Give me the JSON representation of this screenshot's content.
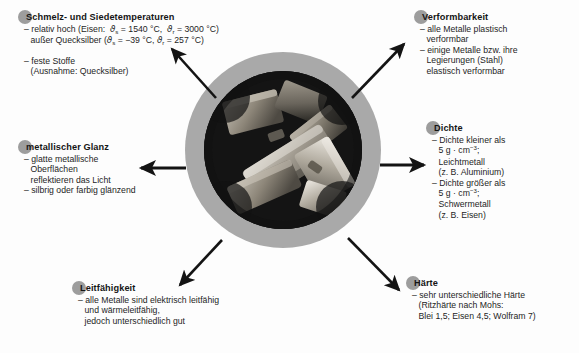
{
  "figure": {
    "type": "radial-callout-diagram",
    "center_image": {
      "name": "metal-ingots-photo",
      "description": "Foto von metallischen Barren / Stangen auf dunklem Grund",
      "ring_color": "#a9a9a9",
      "background_color": "#121212"
    },
    "arrow_count": 6
  },
  "callouts": [
    {
      "id": "melting",
      "heading": "Schmelz- und Siedetemperaturen",
      "lines": [
        {
          "text": "– relativ hoch (Eisen:  ϑs = 1540 °C,  ϑr = 3000 °C)",
          "indent": false
        },
        {
          "text": "außer Quecksilber (ϑs = −39 °C, ϑr = 257 °C)",
          "indent": true
        },
        {
          "text": "",
          "indent": false
        },
        {
          "text": "– feste Stoffe",
          "indent": false
        },
        {
          "text": "(Ausnahme: Quecksilber)",
          "indent": true
        }
      ]
    },
    {
      "id": "gloss",
      "heading": "metallischer Glanz",
      "lines": [
        {
          "text": "– glatte metallische",
          "indent": false
        },
        {
          "text": "Oberflächen",
          "indent": true
        },
        {
          "text": "reflektieren das Licht",
          "indent": true
        },
        {
          "text": "– silbrig oder farbig glänzend",
          "indent": false
        }
      ]
    },
    {
      "id": "conductivity",
      "heading": "Leitfähigkeit",
      "lines": [
        {
          "text": "– alle Metalle sind elektrisch leitfähig",
          "indent": false
        },
        {
          "text": "und wärmeleitfähig,",
          "indent": true
        },
        {
          "text": "jedoch unterschiedlich gut",
          "indent": true
        }
      ]
    },
    {
      "id": "deformability",
      "heading": "Verformbarkeit",
      "lines": [
        {
          "text": "– alle Metalle plastisch",
          "indent": false
        },
        {
          "text": "verformbar",
          "indent": true
        },
        {
          "text": "– einige Metalle bzw. ihre",
          "indent": false
        },
        {
          "text": "Legierungen (Stahl)",
          "indent": true
        },
        {
          "text": "elastisch verformbar",
          "indent": true
        }
      ]
    },
    {
      "id": "density",
      "heading": "Dichte",
      "lines": [
        {
          "text": "– Dichte kleiner als",
          "indent": false
        },
        {
          "text": "5 g · cm⁻³;",
          "indent": true
        },
        {
          "text": "Leichtmetall",
          "indent": true
        },
        {
          "text": "(z. B. Aluminium)",
          "indent": true
        },
        {
          "text": "– Dichte größer als",
          "indent": false
        },
        {
          "text": "5 g · cm⁻³;",
          "indent": true
        },
        {
          "text": "Schwermetall",
          "indent": true
        },
        {
          "text": "(z. B. Eisen)",
          "indent": true
        }
      ]
    },
    {
      "id": "hardness",
      "heading": "Härte",
      "lines": [
        {
          "text": "– sehr unterschiedliche Härte",
          "indent": false
        },
        {
          "text": "(Ritzhärte nach Mohs:",
          "indent": true
        },
        {
          "text": "Blei 1,5; Eisen 4,5; Wolfram 7)",
          "indent": true
        }
      ]
    }
  ],
  "values": {
    "iron_melting_point": "1540 °C",
    "iron_boiling_point": "3000 °C",
    "mercury_melting_point": "−39 °C",
    "mercury_boiling_point": "257 °C",
    "density_threshold": "5 g · cm⁻³",
    "mohs_lead": "1,5",
    "mohs_iron": "4,5",
    "mohs_tungsten": "7"
  },
  "colors": {
    "ring": "#a9a9a9",
    "photo_bg": "#121212",
    "heading_dot": "#9d9d9d",
    "text": "#1b1b1b",
    "arrow": "#141414",
    "page_bg": "#fdfdfd"
  }
}
